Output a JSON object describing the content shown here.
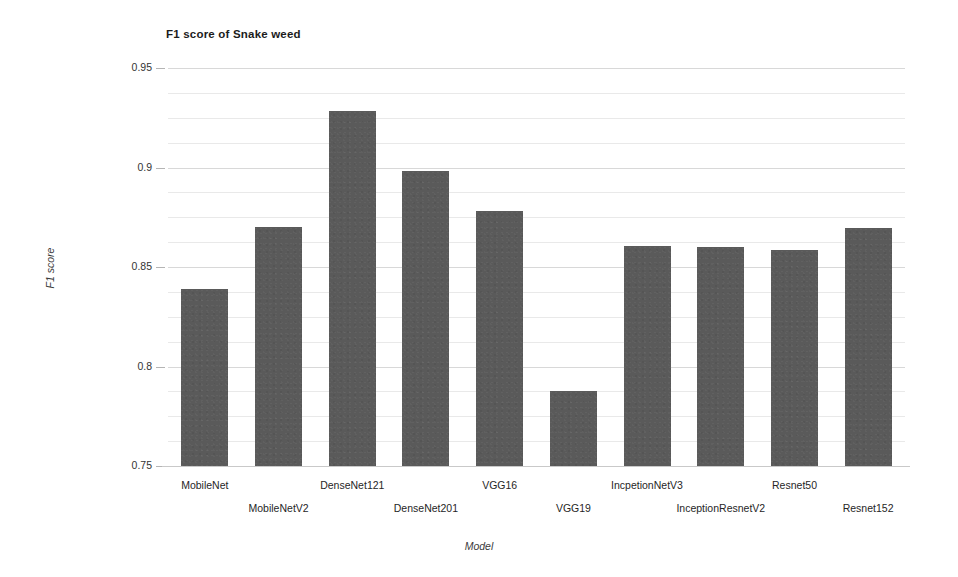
{
  "chart_data": {
    "type": "bar",
    "title": "F1 score of Snake weed",
    "xlabel": "Model",
    "ylabel": "F1 score",
    "ylim": [
      0.75,
      0.95
    ],
    "yticks": [
      0.75,
      0.8,
      0.85,
      0.9,
      0.95
    ],
    "ytick_labels": [
      "0.75",
      "0.8",
      "0.85",
      "0.9",
      "0.95"
    ],
    "grid": true,
    "minor_grid_step": 0.0125,
    "legend": null,
    "legend_position": "none",
    "bar_color": "#5a5a5a",
    "gridline_color": "#e9e9e9",
    "categories": [
      "MobileNet",
      "MobileNetV2",
      "DenseNet121",
      "DenseNet201",
      "VGG16",
      "VGG19",
      "IncpetionNetV3",
      "InceptionResnetV2",
      "Resnet50",
      "Resnet152"
    ],
    "values": [
      0.839,
      0.87,
      0.9285,
      0.8985,
      0.878,
      0.7875,
      0.8605,
      0.86,
      0.8585,
      0.8695
    ]
  }
}
